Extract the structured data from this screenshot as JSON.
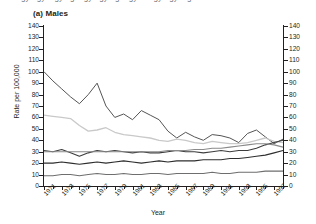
{
  "page": {
    "cut_header": "ergyergy ergyerg ergyergyerg ergyer ergyergy erg",
    "panel_title": "(a) Males"
  },
  "chart_data": {
    "type": "line",
    "title": "(a) Males",
    "xlabel": "Year",
    "ylabel": "Rate per 100,000",
    "xlim": [
      1971,
      1998
    ],
    "ylim": [
      0,
      140
    ],
    "ytick_step": 10,
    "grid": false,
    "legend": "none",
    "yticks": [
      0,
      10,
      20,
      30,
      40,
      50,
      60,
      70,
      80,
      90,
      100,
      110,
      120,
      130,
      140
    ],
    "xticks": [
      1971,
      1973,
      1975,
      1977,
      1979,
      1981,
      1983,
      1985,
      1987,
      1989,
      1991,
      1993,
      1995,
      1997
    ],
    "x": [
      1971,
      1972,
      1973,
      1974,
      1975,
      1976,
      1977,
      1978,
      1979,
      1980,
      1981,
      1982,
      1983,
      1984,
      1985,
      1986,
      1987,
      1988,
      1989,
      1990,
      1991,
      1992,
      1993,
      1994,
      1995,
      1996,
      1997,
      1998
    ],
    "series": [
      {
        "name": "series-1",
        "color": "#555555",
        "width": 1.0,
        "values": [
          100,
          92,
          85,
          78,
          72,
          80,
          90,
          70,
          60,
          63,
          58,
          66,
          62,
          58,
          48,
          42,
          47,
          43,
          40,
          45,
          44,
          42,
          38,
          46,
          49,
          43,
          37,
          41
        ]
      },
      {
        "name": "series-2",
        "color": "#c9c9c9",
        "width": 1.3,
        "values": [
          62,
          61,
          60,
          59,
          53,
          48,
          49,
          51,
          47,
          45,
          44,
          43,
          42,
          40,
          39,
          41,
          40,
          38,
          37,
          39,
          38,
          37,
          37,
          38,
          40,
          42,
          39,
          38
        ]
      },
      {
        "name": "series-3",
        "color": "#3d3d3d",
        "width": 1.1,
        "values": [
          31,
          30,
          32,
          29,
          26,
          29,
          31,
          30,
          31,
          30,
          29,
          30,
          29,
          29,
          30,
          31,
          30,
          30,
          29,
          30,
          31,
          30,
          31,
          31,
          33,
          36,
          38,
          40
        ]
      },
      {
        "name": "series-4",
        "color": "#8a8a8a",
        "width": 1.1,
        "values": [
          30,
          30,
          30,
          30,
          30,
          30,
          30,
          30,
          30,
          30,
          30,
          30,
          30,
          30,
          31,
          31,
          31,
          32,
          32,
          33,
          33,
          34,
          35,
          36,
          37,
          37,
          36,
          34
        ]
      },
      {
        "name": "series-5",
        "color": "#2e2e2e",
        "width": 1.1,
        "values": [
          20,
          20,
          21,
          20,
          19,
          20,
          21,
          20,
          21,
          22,
          21,
          20,
          21,
          22,
          21,
          22,
          22,
          22,
          23,
          23,
          23,
          24,
          24,
          25,
          26,
          27,
          29,
          31
        ]
      },
      {
        "name": "series-6",
        "color": "#6e6e6e",
        "width": 1.1,
        "values": [
          9,
          9,
          10,
          10,
          9,
          10,
          11,
          10,
          10,
          11,
          10,
          10,
          11,
          11,
          10,
          11,
          11,
          11,
          11,
          12,
          11,
          11,
          12,
          12,
          12,
          13,
          13,
          13
        ]
      }
    ]
  }
}
